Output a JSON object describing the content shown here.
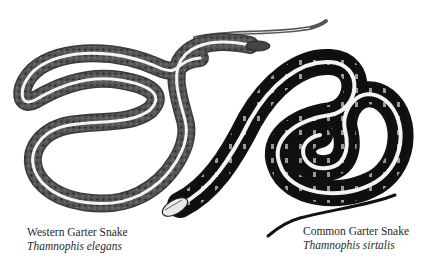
{
  "figure": {
    "colors": {
      "background": "#ffffff",
      "western_body": "#4a4a4a",
      "common_body": "#111111",
      "stripe": "#f4f4f4",
      "text": "#2a2a2a"
    },
    "snakes": [
      {
        "id": "western",
        "common_name": "Western Garter Snake",
        "scientific_name": "Thamnophis elegans"
      },
      {
        "id": "common",
        "common_name": "Common Garter Snake",
        "scientific_name": "Thamnophis sirtalis"
      }
    ]
  }
}
